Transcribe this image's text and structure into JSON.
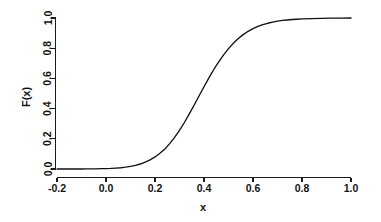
{
  "chart_data": {
    "type": "line",
    "title": "",
    "xlabel": "x",
    "ylabel": "F(x)",
    "xlim": [
      -0.22,
      1.02
    ],
    "ylim": [
      -0.02,
      1.03
    ],
    "grid": false,
    "legend": null,
    "xticks": [
      "-0.2",
      "0.0",
      "0.2",
      "0.4",
      "0.6",
      "0.8",
      "1.0"
    ],
    "xtick_values": [
      -0.2,
      0.0,
      0.2,
      0.4,
      0.6,
      0.8,
      1.0
    ],
    "yticks": [
      "0.0",
      "0.2",
      "0.4",
      "0.6",
      "0.8",
      "1.0"
    ],
    "ytick_values": [
      0.0,
      0.2,
      0.4,
      0.6,
      0.8,
      1.0
    ],
    "series": [
      {
        "name": "F(x)",
        "color": "#111111",
        "x": [
          -0.2,
          -0.18,
          -0.16,
          -0.14,
          -0.12,
          -0.1,
          -0.08,
          -0.06,
          -0.04,
          -0.02,
          0.0,
          0.02,
          0.04,
          0.06,
          0.08,
          0.1,
          0.12,
          0.14,
          0.16,
          0.18,
          0.2,
          0.22,
          0.24,
          0.26,
          0.28,
          0.3,
          0.32,
          0.34,
          0.36,
          0.38,
          0.4,
          0.42,
          0.44,
          0.46,
          0.48,
          0.5,
          0.52,
          0.54,
          0.56,
          0.58,
          0.6,
          0.62,
          0.64,
          0.66,
          0.68,
          0.7,
          0.72,
          0.74,
          0.76,
          0.78,
          0.8,
          0.84,
          0.88,
          0.92,
          0.96,
          1.0
        ],
        "y": [
          0.0,
          0.0,
          0.0,
          0.0,
          0.0,
          0.0,
          0.001,
          0.001,
          0.001,
          0.002,
          0.003,
          0.004,
          0.006,
          0.008,
          0.012,
          0.017,
          0.024,
          0.033,
          0.045,
          0.06,
          0.08,
          0.104,
          0.133,
          0.168,
          0.209,
          0.256,
          0.308,
          0.365,
          0.424,
          0.485,
          0.545,
          0.604,
          0.659,
          0.71,
          0.756,
          0.797,
          0.833,
          0.864,
          0.89,
          0.912,
          0.93,
          0.944,
          0.956,
          0.965,
          0.973,
          0.979,
          0.984,
          0.987,
          0.99,
          0.992,
          0.994,
          0.996,
          0.998,
          0.999,
          0.999,
          1.0
        ]
      }
    ]
  },
  "axes": {
    "x_title": "x",
    "y_title": "F(x)"
  },
  "colors": {
    "curve": "#111111",
    "axis": "#1a1a1a",
    "background": "#ffffff"
  }
}
